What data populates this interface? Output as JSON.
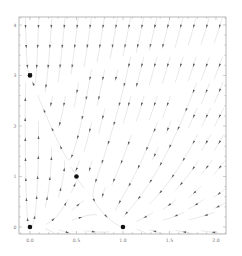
{
  "chart_data": {
    "type": "streamplot",
    "title": "",
    "xlabel": "",
    "ylabel": "",
    "xlim": [
      -0.118,
      2.108
    ],
    "ylim": [
      -0.139,
      4.158
    ],
    "grid": false,
    "legend": null,
    "x_ticks": [
      {
        "value": 0.0,
        "label": "0.0"
      },
      {
        "value": 0.5,
        "label": "0.5"
      },
      {
        "value": 1.0,
        "label": "1.0"
      },
      {
        "value": 1.5,
        "label": "1.5"
      },
      {
        "value": 2.0,
        "label": "2.0"
      }
    ],
    "y_ticks": [
      {
        "value": 0,
        "label": "0"
      },
      {
        "value": 1,
        "label": "1"
      },
      {
        "value": 2,
        "label": "2"
      },
      {
        "value": 3,
        "label": "3"
      },
      {
        "value": 4,
        "label": "4"
      }
    ],
    "x_minor_step": 0.1,
    "y_minor_step": 0.2,
    "vector_field": {
      "description": "Competitive Lotka-Volterra type flow: dx/dt = x(a1 - b11 x - b12 y), dy/dt = y(a2 - b21 x - b22 y)",
      "a1": 1,
      "b11": 1,
      "b12": 0.5,
      "a2": 3,
      "b21": 4,
      "b22": 1
    },
    "equilibrium_points": [
      {
        "x": 0.0,
        "y": 0.0
      },
      {
        "x": 1.0,
        "y": 0.0
      },
      {
        "x": 0.0,
        "y": 3.0
      },
      {
        "x": 0.5,
        "y": 1.0
      }
    ],
    "colors": {
      "streamline": "#cfcfcf",
      "arrow": "#5a5a5a",
      "point": "#111111",
      "frame": "#9a9a9a"
    }
  }
}
